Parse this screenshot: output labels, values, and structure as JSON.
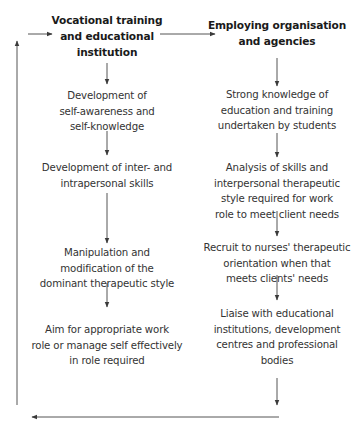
{
  "colors": {
    "line": "#4a4a4a",
    "text": "#333333",
    "heading": "#1a1a1a",
    "background": "#ffffff"
  },
  "left_column": {
    "heading": [
      "Vocational training",
      "and educational",
      "institution"
    ],
    "steps": [
      [
        "Development of",
        "self-awareness and",
        "self-knowledge"
      ],
      [
        "Development of inter- and",
        "intrapersonal skills"
      ],
      [
        "Manipulation and",
        "modification of the",
        "dominant therapeutic style"
      ],
      [
        "Aim for appropriate work",
        "role or manage self effectively",
        "in role required"
      ]
    ]
  },
  "right_column": {
    "heading": [
      "Employing organisation",
      "and agencies"
    ],
    "steps": [
      [
        "Strong knowledge of",
        "education and training",
        "undertaken by students"
      ],
      [
        "Analysis of skills and",
        "interpersonal therapeutic",
        "style required for work",
        "role to meet client needs"
      ],
      [
        "Recruit to nurses' therapeutic",
        "orientation when that",
        "meets clients' needs"
      ],
      [
        "Liaise with educational",
        "institutions, development",
        "centres and professional",
        "bodies"
      ]
    ]
  },
  "connectors": {
    "arrow_icons": [
      "arrow-right-icon",
      "arrow-down-icon",
      "arrow-left-icon",
      "arrow-up-icon"
    ]
  }
}
